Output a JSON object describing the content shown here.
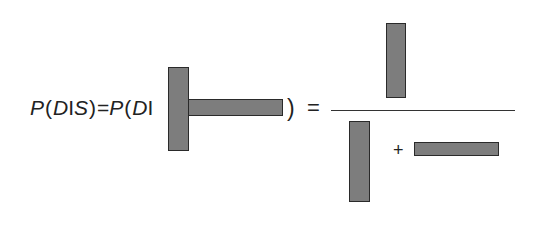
{
  "equation": {
    "lhs": {
      "p1": "P",
      "open1": "(",
      "d1": "D",
      "given1": "I",
      "s": "S",
      "close1": ")",
      "equals1": "=",
      "p2": "P",
      "open2": "(",
      "d2": "D",
      "given2": "I"
    },
    "close2": ")",
    "equals2": "=",
    "plus": "+",
    "bar_color": "#7d7d7d",
    "bar_border": "#2a2a2a",
    "bars": {
      "t_vertical": {
        "x": 168,
        "y": 67,
        "w": 21,
        "h": 84
      },
      "t_horizontal": {
        "x": 188,
        "y": 99,
        "w": 95,
        "h": 17
      },
      "numerator": {
        "x": 386,
        "y": 23,
        "w": 20,
        "h": 75
      },
      "denominator_vertical": {
        "x": 349,
        "y": 121,
        "w": 21,
        "h": 81
      },
      "denominator_horizontal": {
        "x": 414,
        "y": 142,
        "w": 85,
        "h": 14
      }
    }
  }
}
